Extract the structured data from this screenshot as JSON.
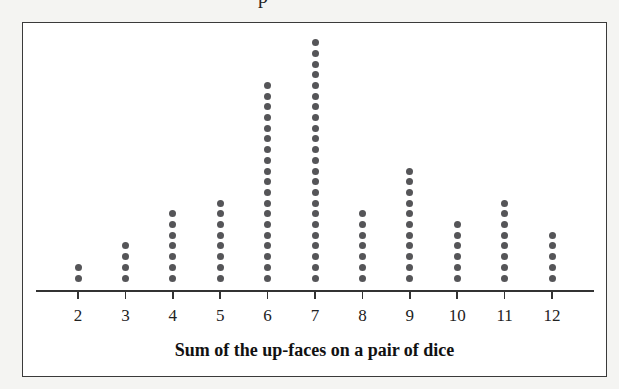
{
  "header": {
    "cropped_text": "p"
  },
  "chart_data": {
    "type": "dotplot",
    "title": "",
    "xlabel": "Sum of the up-faces on a pair of dice",
    "ylabel": "",
    "categories": [
      "2",
      "3",
      "4",
      "5",
      "6",
      "7",
      "8",
      "9",
      "10",
      "11",
      "12"
    ],
    "values": [
      2,
      4,
      7,
      8,
      19,
      23,
      7,
      11,
      6,
      8,
      5
    ],
    "total": 100,
    "grid": false,
    "legend": null,
    "dot_color": "#555558"
  }
}
